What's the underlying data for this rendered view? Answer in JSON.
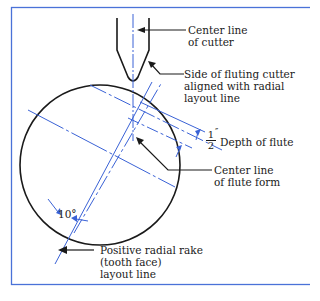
{
  "figure": {
    "colors": {
      "blue": "#3a62d6",
      "black": "#1a1a1a",
      "border": "#4a72d8"
    },
    "labels": {
      "cutter_center_line": {
        "line1": "Center line",
        "line2": "of cutter"
      },
      "cutter_side": {
        "line1": "Side of fluting cutter",
        "line2": "aligned with radial",
        "line3": "layout line"
      },
      "depth": {
        "numerator": "1",
        "prime": "″",
        "denominator": "2",
        "text": "Depth of flute"
      },
      "flute_center": {
        "line1": "Center line",
        "line2": "of flute form"
      },
      "rake": {
        "line1": "Positive radial rake",
        "line2": "(tooth face)",
        "line3": "layout line"
      },
      "angle": "10°"
    }
  }
}
